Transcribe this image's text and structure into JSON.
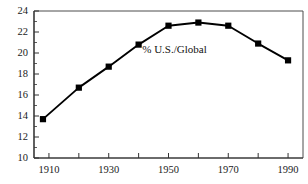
{
  "chart_data": {
    "type": "line",
    "title": "",
    "subtitle": "",
    "xlabel": "",
    "ylabel": "",
    "xlim": [
      1905,
      1995
    ],
    "ylim": [
      10,
      24
    ],
    "grid": false,
    "legend_position": "inline-annotation",
    "annotations": [
      {
        "text": "% U.S./Global",
        "x": 1952,
        "y": 20.25
      }
    ],
    "x_tick_labels": [
      "1910",
      "1930",
      "1950",
      "1970",
      "1990"
    ],
    "x_tick_values": [
      1910,
      1930,
      1950,
      1970,
      1990
    ],
    "x_minor_ticks": [
      1920,
      1940,
      1960,
      1980
    ],
    "y_tick_labels": [
      "10",
      "12",
      "14",
      "16",
      "18",
      "20",
      "22",
      "24"
    ],
    "y_tick_values": [
      10,
      12,
      14,
      16,
      18,
      20,
      22,
      24
    ],
    "y_minor_ticks": [
      11,
      13,
      15,
      17,
      19,
      21,
      23
    ],
    "series": [
      {
        "name": "% U.S./Global",
        "marker": "square",
        "color": "#000000",
        "x": [
          1908,
          1920,
          1930,
          1940,
          1950,
          1960,
          1970,
          1980,
          1990
        ],
        "values": [
          13.7,
          16.7,
          18.7,
          20.8,
          22.6,
          22.9,
          22.6,
          20.9,
          19.3
        ]
      }
    ]
  },
  "colors": {
    "line": "#000000",
    "marker": "#000000",
    "axis": "#4d4d4d",
    "text": "#1a1a1a",
    "background": "#ffffff"
  }
}
